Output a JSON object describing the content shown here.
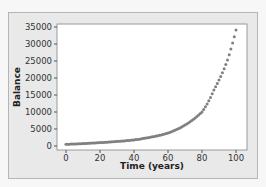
{
  "chart_data": {
    "type": "scatter",
    "title": "",
    "xlabel": "Time (years)",
    "ylabel": "Balance",
    "xlim": [
      0,
      100
    ],
    "ylim": [
      0,
      35000
    ],
    "xticks": [
      0,
      20,
      40,
      60,
      80,
      100
    ],
    "yticks": [
      0,
      5000,
      10000,
      15000,
      20000,
      25000,
      30000,
      35000
    ],
    "grid": false,
    "legend": null,
    "marker_color": "#808080",
    "anchor_points": {
      "x": [
        0,
        20,
        40,
        60,
        80,
        87,
        95,
        100
      ],
      "y": [
        500,
        1000,
        1800,
        3800,
        10000,
        16500,
        25300,
        34100
      ]
    },
    "x": [],
    "y": []
  },
  "axes": {
    "xlabel": "Time (years)",
    "ylabel": "Balance",
    "xtick_labels": [
      "0",
      "20",
      "40",
      "60",
      "80",
      "100"
    ],
    "ytick_labels": [
      "0",
      "5000",
      "10000",
      "15000",
      "20000",
      "25000",
      "30000",
      "35000"
    ]
  },
  "colors": {
    "panel_bg": "#e9e9e9",
    "plot_bg": "#ffffff",
    "marker": "#808080"
  }
}
